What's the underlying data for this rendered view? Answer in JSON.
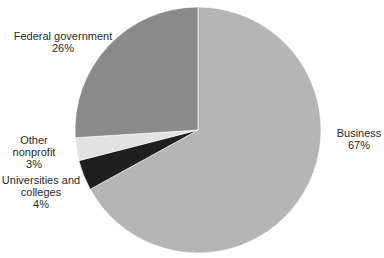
{
  "chart_data": {
    "type": "pie",
    "title": "",
    "start_angle_deg": 0,
    "direction": "clockwise",
    "center": [
      198,
      130
    ],
    "radius": 123,
    "slices": [
      {
        "label": "Business",
        "value": 67,
        "display": "67%",
        "color": "#b5b5b5"
      },
      {
        "label": "Universities and colleges",
        "value": 4,
        "display": "4%",
        "color": "#1f1f1f"
      },
      {
        "label": "Other nonprofit",
        "value": 3,
        "display": "3%",
        "color": "#e2e2e2"
      },
      {
        "label": "Federal government",
        "value": 26,
        "display": "26%",
        "color": "#8a8a8a"
      }
    ]
  },
  "labels": {
    "federal": {
      "line1": "Federal government",
      "pct": "26%"
    },
    "other": {
      "line1": "Other",
      "line2": "nonprofit",
      "pct": "3%"
    },
    "universities": {
      "line1": "Universities and",
      "line2": "colleges",
      "pct": "4%"
    },
    "business": {
      "line1": "Business",
      "pct": "67%"
    }
  }
}
